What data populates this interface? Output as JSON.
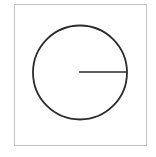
{
  "figure": {
    "canvas": {
      "width": 156,
      "height": 157,
      "background": "#ffffff"
    },
    "frame": {
      "label": "Bounding box border",
      "x": 14.5,
      "y": 4.5,
      "width": 132,
      "height": 141,
      "stroke": "#c2c2c2",
      "stroke_width": 1,
      "fill": "none"
    },
    "circle": {
      "label": "Circle outline",
      "center_x": 80,
      "center_y": 72.5,
      "radius": 47,
      "stroke": "#2b2b2b",
      "stroke_width": 1.8,
      "fill": "none"
    },
    "radius_line": {
      "label": "Radius segment from center to circumference",
      "x1": 79,
      "y1": 72,
      "x2": 127,
      "y2": 72,
      "stroke": "#2b2b2b",
      "stroke_width": 1.6,
      "angle_degrees": 0,
      "direction": "east"
    }
  },
  "chart_data": {
    "type": "diagram",
    "shapes": [
      {
        "kind": "rectangle",
        "name": "frame",
        "x": 14.5,
        "y": 4.5,
        "width": 132,
        "height": 141,
        "stroke": "#c2c2c2",
        "fill": "none"
      },
      {
        "kind": "circle",
        "name": "circle",
        "cx": 80,
        "cy": 72.5,
        "r": 47,
        "stroke": "#2b2b2b",
        "fill": "none"
      },
      {
        "kind": "line",
        "name": "radius",
        "x1": 79,
        "y1": 72,
        "x2": 127,
        "y2": 72,
        "stroke": "#2b2b2b",
        "length": 48,
        "angle_degrees": 0
      }
    ],
    "labels": [],
    "legend": [],
    "grid": false
  }
}
